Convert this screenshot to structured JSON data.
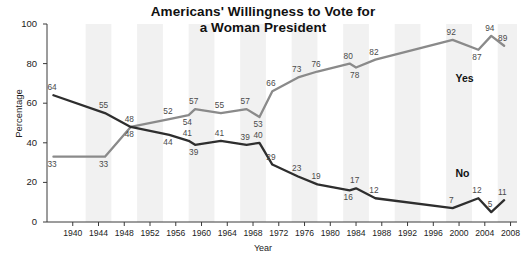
{
  "chart_data": {
    "type": "line",
    "title": "Americans'  Willingness to Vote for a Woman President",
    "title_lines": [
      "Americans'  Willingness to Vote for",
      "a Woman President"
    ],
    "xlabel": "Year",
    "ylabel": "Percentage",
    "ylim": [
      0,
      100
    ],
    "xlim": [
      1936,
      2009
    ],
    "grid": false,
    "background_bands": true,
    "legend_position": "inline-right",
    "y_ticks": [
      0,
      20,
      40,
      60,
      80,
      100
    ],
    "x_ticks": [
      1940,
      1944,
      1948,
      1952,
      1956,
      1960,
      1964,
      1968,
      1972,
      1976,
      1980,
      1984,
      1988,
      1992,
      1996,
      2000,
      2004,
      2008
    ],
    "series": [
      {
        "name": "Yes",
        "color": "#8a8a8a",
        "label_tag": "Yes",
        "points": [
          {
            "x": 1937,
            "y": 33,
            "label": "33",
            "pos": "below"
          },
          {
            "x": 1945,
            "y": 33,
            "label": "33",
            "pos": "below"
          },
          {
            "x": 1949,
            "y": 48,
            "label": "48",
            "pos": "below"
          },
          {
            "x": 1955,
            "y": 52,
            "label": "52",
            "pos": "above"
          },
          {
            "x": 1958,
            "y": 54,
            "label": "54",
            "pos": "below"
          },
          {
            "x": 1959,
            "y": 57,
            "label": "57",
            "pos": "above"
          },
          {
            "x": 1963,
            "y": 55,
            "label": "55",
            "pos": "above"
          },
          {
            "x": 1967,
            "y": 57,
            "label": "57",
            "pos": "above"
          },
          {
            "x": 1969,
            "y": 53,
            "label": "53",
            "pos": "below"
          },
          {
            "x": 1971,
            "y": 66,
            "label": "66",
            "pos": "above"
          },
          {
            "x": 1975,
            "y": 73,
            "label": "73",
            "pos": "above"
          },
          {
            "x": 1978,
            "y": 76,
            "label": "76",
            "pos": "above"
          },
          {
            "x": 1983,
            "y": 80,
            "label": "80",
            "pos": "above"
          },
          {
            "x": 1984,
            "y": 78,
            "label": "78",
            "pos": "below"
          },
          {
            "x": 1987,
            "y": 82,
            "label": "82",
            "pos": "above"
          },
          {
            "x": 1999,
            "y": 92,
            "label": "92",
            "pos": "above"
          },
          {
            "x": 2003,
            "y": 87,
            "label": "87",
            "pos": "below"
          },
          {
            "x": 2005,
            "y": 94,
            "label": "94",
            "pos": "above"
          },
          {
            "x": 2007,
            "y": 89,
            "label": "89",
            "pos": "above"
          }
        ]
      },
      {
        "name": "No",
        "color": "#2e2e2e",
        "label_tag": "No",
        "points": [
          {
            "x": 1937,
            "y": 64,
            "label": "64",
            "pos": "above"
          },
          {
            "x": 1945,
            "y": 55,
            "label": "55",
            "pos": "above"
          },
          {
            "x": 1949,
            "y": 48,
            "label": "48",
            "pos": "above"
          },
          {
            "x": 1955,
            "y": 44,
            "label": "44",
            "pos": "below"
          },
          {
            "x": 1958,
            "y": 41,
            "label": "41",
            "pos": "above"
          },
          {
            "x": 1959,
            "y": 39,
            "label": "39",
            "pos": "below"
          },
          {
            "x": 1963,
            "y": 41,
            "label": "41",
            "pos": "above"
          },
          {
            "x": 1967,
            "y": 39,
            "label": "39",
            "pos": "above"
          },
          {
            "x": 1969,
            "y": 40,
            "label": "40",
            "pos": "above"
          },
          {
            "x": 1971,
            "y": 29,
            "label": "29",
            "pos": "above"
          },
          {
            "x": 1975,
            "y": 23,
            "label": "23",
            "pos": "above"
          },
          {
            "x": 1978,
            "y": 19,
            "label": "19",
            "pos": "above"
          },
          {
            "x": 1983,
            "y": 16,
            "label": "16",
            "pos": "below"
          },
          {
            "x": 1984,
            "y": 17,
            "label": "17",
            "pos": "above"
          },
          {
            "x": 1987,
            "y": 12,
            "label": "12",
            "pos": "above"
          },
          {
            "x": 1999,
            "y": 7,
            "label": "7",
            "pos": "above"
          },
          {
            "x": 2003,
            "y": 12,
            "label": "12",
            "pos": "above"
          },
          {
            "x": 2005,
            "y": 5,
            "label": "5",
            "pos": "above"
          },
          {
            "x": 2007,
            "y": 11,
            "label": "11",
            "pos": "above"
          }
        ]
      }
    ],
    "annotations": [
      {
        "text": "Yes",
        "x": 2001,
        "y": 72,
        "name": "series-tag-yes"
      },
      {
        "text": "No",
        "x": 2001,
        "y": 24,
        "name": "series-tag-no"
      }
    ]
  }
}
